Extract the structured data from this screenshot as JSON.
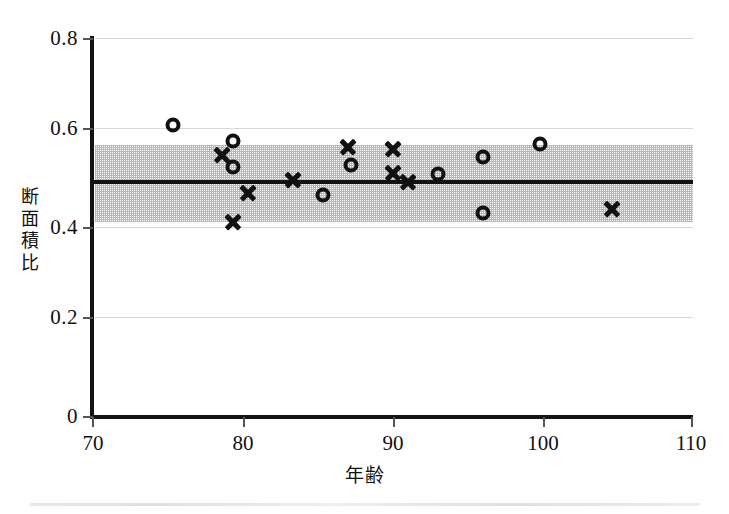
{
  "chart_data": {
    "type": "scatter",
    "title": "",
    "xlabel": "年齢",
    "ylabel": "断面積比",
    "ylabel_chars": [
      "断",
      "面",
      "積",
      "比"
    ],
    "xlim": [
      70,
      110
    ],
    "ylim": [
      0,
      0.8
    ],
    "xticks": [
      70,
      80,
      90,
      100,
      110
    ],
    "xtick_labels": [
      "70",
      "80",
      "90",
      "100",
      "110"
    ],
    "yticks": [
      0,
      0.2,
      0.4,
      0.6,
      0.8
    ],
    "ytick_labels": [
      "0",
      "0.2",
      "0.4",
      "0.6",
      "0.8"
    ],
    "grid": "horizontal",
    "legend": "none",
    "mean_line": {
      "label": "",
      "value": 0.497
    },
    "reference_band": {
      "label": "",
      "lower": 0.412,
      "upper": 0.575,
      "fill": "#8d8d8d",
      "pattern": "dotted-screen"
    },
    "series": [
      {
        "name": "circle",
        "marker": "open-circle",
        "color": "#111111",
        "points": [
          {
            "x": 75.3,
            "y": 0.617
          },
          {
            "x": 79.3,
            "y": 0.583
          },
          {
            "x": 79.3,
            "y": 0.528
          },
          {
            "x": 85.3,
            "y": 0.468
          },
          {
            "x": 87.2,
            "y": 0.532
          },
          {
            "x": 93.0,
            "y": 0.513
          },
          {
            "x": 96.0,
            "y": 0.549
          },
          {
            "x": 96.0,
            "y": 0.43
          },
          {
            "x": 99.8,
            "y": 0.577
          }
        ]
      },
      {
        "name": "cross",
        "marker": "x-cross",
        "color": "#111111",
        "points": [
          {
            "x": 78.6,
            "y": 0.554
          },
          {
            "x": 79.3,
            "y": 0.412
          },
          {
            "x": 80.3,
            "y": 0.472
          },
          {
            "x": 83.3,
            "y": 0.5
          },
          {
            "x": 87.0,
            "y": 0.57
          },
          {
            "x": 90.0,
            "y": 0.565
          },
          {
            "x": 90.0,
            "y": 0.515
          },
          {
            "x": 91.0,
            "y": 0.495
          },
          {
            "x": 104.6,
            "y": 0.44
          }
        ]
      }
    ]
  }
}
